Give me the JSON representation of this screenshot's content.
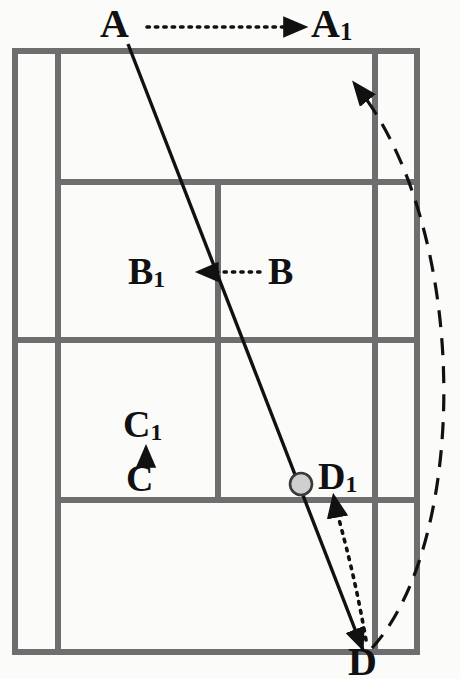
{
  "diagram": {
    "sport": "badminton",
    "colors": {
      "background": "#fbfbfa",
      "court_line": "#6e6e6e",
      "trajectory": "#111111",
      "shuttle_fill": "#cfcfcf",
      "shuttle_stroke": "#3a3a3a",
      "label_text": "#111111"
    },
    "labels": [
      {
        "id": "A",
        "text": "A",
        "sub": "",
        "x": 118,
        "y": 26
      },
      {
        "id": "A1",
        "text": "A",
        "sub": "1",
        "x": 330,
        "y": 26
      },
      {
        "id": "B",
        "text": "B",
        "sub": "",
        "x": 283,
        "y": 272
      },
      {
        "id": "B1",
        "text": "B",
        "sub": "1",
        "x": 145,
        "y": 272
      },
      {
        "id": "C",
        "text": "C",
        "sub": "",
        "x": 143,
        "y": 479
      },
      {
        "id": "C1",
        "text": "C",
        "sub": "1",
        "x": 143,
        "y": 425
      },
      {
        "id": "D",
        "text": "D",
        "sub": "",
        "x": 364,
        "y": 664
      },
      {
        "id": "D1",
        "text": "D",
        "sub": "1",
        "x": 336,
        "y": 477
      }
    ],
    "movement_arrows": [
      {
        "id": "A-to-A1",
        "from": "A",
        "to": "A1",
        "style": "dotted",
        "direction": "right"
      },
      {
        "id": "B-to-B1",
        "from": "B",
        "to": "B1",
        "style": "dotted",
        "direction": "left"
      },
      {
        "id": "C-to-C1",
        "from": "C",
        "to": "C1",
        "style": "dotted",
        "direction": "up"
      },
      {
        "id": "D-to-D1",
        "from": "D",
        "to": "D1",
        "style": "dotted",
        "direction": "up"
      }
    ],
    "shuttle": {
      "id": "shuttle-marker",
      "x": 301,
      "y": 484,
      "r": 11
    },
    "trajectories": [
      {
        "id": "solid-shot-line",
        "style": "solid",
        "from": "A",
        "to": "D",
        "arrowhead": "at-D"
      },
      {
        "id": "dashed-return-curve",
        "style": "dashed",
        "from": "D",
        "to": "upper-right-court",
        "arrowhead": "at-top"
      }
    ],
    "court": {
      "outer": {
        "x": 12,
        "y": 48,
        "w": 408,
        "h": 607
      },
      "vertical_lines_x": [
        12,
        58,
        218,
        375,
        420
      ],
      "horizontal_lines_y": [
        48,
        182,
        340,
        500,
        655
      ],
      "line_width": 6
    }
  }
}
